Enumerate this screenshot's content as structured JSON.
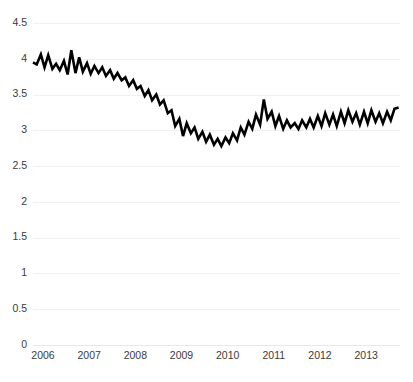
{
  "chart_data": {
    "type": "line",
    "title": "",
    "subtitle": "",
    "xlabel": "",
    "ylabel": "",
    "xlim": [
      2006.0,
      2013.95
    ],
    "ylim": [
      0,
      4.5
    ],
    "grid": true,
    "legend": "none",
    "y_ticks": [
      0,
      0.5,
      1,
      1.5,
      2,
      2.5,
      3,
      3.5,
      4,
      4.5
    ],
    "y_tick_labels": [
      "0",
      "0.5",
      "1",
      "1.5",
      "2",
      "2.5",
      "3",
      "3.5",
      "4",
      "4.5"
    ],
    "x_ticks": [
      2006,
      2007,
      2008,
      2009,
      2010,
      2011,
      2012,
      2013
    ],
    "x_tick_labels": [
      "2006",
      "2007",
      "2008",
      "2009",
      "2010",
      "2011",
      "2012",
      "2013"
    ],
    "series": [
      {
        "name": "series-1",
        "color": "#000000",
        "x": [
          2006.0,
          2006.08,
          2006.17,
          2006.25,
          2006.33,
          2006.42,
          2006.5,
          2006.58,
          2006.67,
          2006.75,
          2006.83,
          2006.92,
          2007.0,
          2007.08,
          2007.17,
          2007.25,
          2007.33,
          2007.42,
          2007.5,
          2007.58,
          2007.67,
          2007.75,
          2007.83,
          2007.92,
          2008.0,
          2008.08,
          2008.17,
          2008.25,
          2008.33,
          2008.42,
          2008.5,
          2008.58,
          2008.67,
          2008.75,
          2008.83,
          2008.92,
          2009.0,
          2009.08,
          2009.17,
          2009.25,
          2009.33,
          2009.42,
          2009.5,
          2009.58,
          2009.67,
          2009.75,
          2009.83,
          2009.92,
          2010.0,
          2010.08,
          2010.17,
          2010.25,
          2010.33,
          2010.42,
          2010.5,
          2010.58,
          2010.67,
          2010.75,
          2010.83,
          2010.92,
          2011.0,
          2011.08,
          2011.17,
          2011.25,
          2011.33,
          2011.42,
          2011.5,
          2011.58,
          2011.67,
          2011.75,
          2011.83,
          2011.92,
          2012.0,
          2012.08,
          2012.17,
          2012.25,
          2012.33,
          2012.42,
          2012.5,
          2012.58,
          2012.67,
          2012.75,
          2012.83,
          2012.92,
          2013.0,
          2013.08,
          2013.17,
          2013.25,
          2013.33,
          2013.42,
          2013.5,
          2013.58,
          2013.67,
          2013.75,
          2013.83,
          2013.92
        ],
        "values": [
          3.95,
          3.92,
          4.06,
          3.88,
          4.05,
          3.86,
          3.93,
          3.84,
          3.97,
          3.78,
          4.12,
          3.8,
          4.02,
          3.82,
          3.94,
          3.79,
          3.9,
          3.8,
          3.88,
          3.76,
          3.84,
          3.72,
          3.8,
          3.7,
          3.74,
          3.62,
          3.7,
          3.58,
          3.62,
          3.48,
          3.56,
          3.42,
          3.5,
          3.36,
          3.42,
          3.24,
          3.28,
          3.06,
          3.16,
          2.92,
          3.1,
          2.96,
          3.04,
          2.88,
          2.98,
          2.84,
          2.94,
          2.8,
          2.88,
          2.78,
          2.9,
          2.82,
          2.96,
          2.86,
          3.04,
          2.94,
          3.12,
          3.02,
          3.22,
          3.08,
          3.43,
          3.16,
          3.26,
          3.06,
          3.2,
          3.02,
          3.14,
          3.04,
          3.1,
          3.02,
          3.14,
          3.04,
          3.16,
          3.04,
          3.2,
          3.06,
          3.24,
          3.08,
          3.22,
          3.06,
          3.26,
          3.1,
          3.28,
          3.12,
          3.24,
          3.08,
          3.26,
          3.1,
          3.28,
          3.12,
          3.24,
          3.1,
          3.26,
          3.14,
          3.3,
          3.32
        ]
      }
    ]
  },
  "plot_geometry": {
    "left": 33,
    "right": 400,
    "top": 23,
    "bottom": 345
  }
}
